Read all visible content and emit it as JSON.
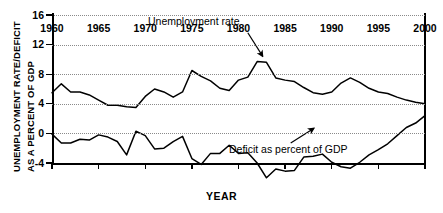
{
  "chart_data": {
    "type": "line",
    "title": "",
    "xlabel": "YEAR",
    "ylabel_line1": "UNEMPLOYMENT RATE/DEFICIT",
    "ylabel_line2": "AS A PERCENT OF GDP",
    "xlim": [
      1960,
      2000
    ],
    "ylim": [
      -4,
      16
    ],
    "yticks": [
      -4,
      0,
      4,
      8,
      12,
      16
    ],
    "ytick_labels": [
      "-4",
      "0",
      "4",
      "8",
      "12",
      "16"
    ],
    "xticks": [
      1960,
      1965,
      1970,
      1975,
      1980,
      1985,
      1990,
      1995,
      2000
    ],
    "xtick_labels": [
      "1960",
      "1965",
      "1970",
      "1975",
      "1980",
      "1985",
      "1990",
      "1995",
      "2000"
    ],
    "grid": "horizontal-dotted",
    "legend": "none",
    "x": [
      1960,
      1961,
      1962,
      1963,
      1964,
      1965,
      1966,
      1967,
      1968,
      1969,
      1970,
      1971,
      1972,
      1973,
      1974,
      1975,
      1976,
      1977,
      1978,
      1979,
      1980,
      1981,
      1982,
      1983,
      1984,
      1985,
      1986,
      1987,
      1988,
      1989,
      1990,
      1991,
      1992,
      1993,
      1994,
      1995,
      1996,
      1997,
      1998,
      1999,
      2000
    ],
    "series": [
      {
        "name": "Unemployment rate",
        "values": [
          5.5,
          6.7,
          5.6,
          5.6,
          5.2,
          4.5,
          3.8,
          3.8,
          3.6,
          3.5,
          5.0,
          6.0,
          5.6,
          4.9,
          5.6,
          8.5,
          7.7,
          7.1,
          6.1,
          5.8,
          7.2,
          7.6,
          9.7,
          9.6,
          7.5,
          7.2,
          7.0,
          6.2,
          5.5,
          5.3,
          5.6,
          6.8,
          7.5,
          6.9,
          6.1,
          5.6,
          5.4,
          4.9,
          4.5,
          4.2,
          4.0
        ]
      },
      {
        "name": "Deficit as percent of GDP",
        "values": [
          -0.1,
          -1.3,
          -1.3,
          -0.8,
          -0.9,
          -0.2,
          -0.5,
          -1.1,
          -2.9,
          0.3,
          -0.3,
          -2.1,
          -2.0,
          -1.1,
          -0.4,
          -3.4,
          -4.2,
          -2.7,
          -2.7,
          -1.6,
          -2.7,
          -2.6,
          -4.0,
          -6.0,
          -4.8,
          -5.1,
          -5.0,
          -3.2,
          -3.1,
          -2.8,
          -3.9,
          -4.5,
          -4.7,
          -3.9,
          -2.9,
          -2.2,
          -1.4,
          -0.3,
          0.8,
          1.4,
          2.4
        ]
      }
    ],
    "annotations": [
      {
        "id": "unemployment-rate",
        "text": "Unemployment rate",
        "arrow_from": [
          1981.0,
          13.6
        ],
        "arrow_to": [
          1982.6,
          10.4
        ]
      },
      {
        "id": "deficit-percent-gdp",
        "text": "Deficit as percent of GDP",
        "arrow_from": [
          1985.6,
          -1.3
        ],
        "arrow_to": [
          1988.1,
          0.7
        ]
      }
    ]
  }
}
